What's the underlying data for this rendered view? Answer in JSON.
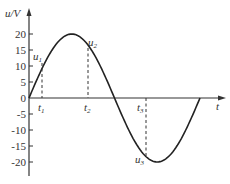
{
  "chart_data": {
    "type": "line",
    "title": "",
    "xlabel": "t",
    "ylabel": "u/V",
    "ylim": [
      -20,
      20
    ],
    "yticks": [
      20,
      15,
      10,
      5,
      0,
      -5,
      -10,
      -15,
      -20
    ],
    "ytick_labels": [
      "20",
      "15",
      "10",
      "5",
      "0",
      "-5",
      "-10",
      "-15",
      "-20"
    ],
    "xtick_labels": [
      "t1",
      "t2",
      "t3"
    ],
    "series": [
      {
        "name": "u(t) sine wave, amplitude 20 V, one full period",
        "amplitude": 20
      }
    ],
    "annotations": [
      {
        "label": "u1",
        "at": "t1",
        "value": 11
      },
      {
        "label": "u2",
        "at": "t2",
        "value": 15.5
      },
      {
        "label": "u3",
        "at": "t3",
        "value": -18.7
      }
    ],
    "grid": false,
    "legend": null
  },
  "labels": {
    "y_axis": "u/V",
    "x_axis": "t",
    "origin": "0",
    "u1": "u",
    "u1_sub": "1",
    "u2": "u",
    "u2_sub": "2",
    "u3": "u",
    "u3_sub": "3",
    "t1": "t",
    "t1_sub": "1",
    "t2": "t",
    "t2_sub": "2",
    "t3": "t",
    "t3_sub": "3",
    "ticks": [
      "20",
      "15",
      "10",
      "5",
      "-5",
      "-10",
      "-15",
      "-20"
    ]
  }
}
